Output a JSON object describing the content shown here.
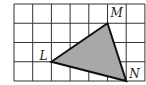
{
  "diagram": {
    "type": "grid-triangle",
    "grid": {
      "columns": 7,
      "rows": 4,
      "origin_px": [
        14,
        4
      ],
      "cell_w": 18.7,
      "cell_h": 19.25,
      "line_color": "#333333"
    },
    "triangle": {
      "fill": "#a8a8a8",
      "stroke": "#111111",
      "vertices": [
        {
          "name": "L",
          "grid": [
            2,
            3
          ]
        },
        {
          "name": "M",
          "grid": [
            5,
            1
          ]
        },
        {
          "name": "N",
          "grid": [
            6,
            4
          ]
        }
      ]
    },
    "labels": {
      "L": "L",
      "M": "M",
      "N": "N"
    }
  }
}
